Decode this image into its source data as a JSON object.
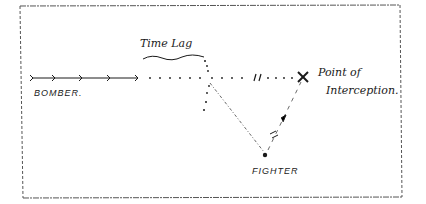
{
  "diagram": {
    "labels": {
      "time_lag": "Time Lag",
      "bomber": "BOMBER.",
      "point_of_interception_line1": "Point of",
      "point_of_interception_line2": "Interception.",
      "fighter": "FIGHTER"
    },
    "elements": {
      "bomber_track": "arrowed line then dotted line to point of interception",
      "fighter_track": "dashed line from fighter to point of interception",
      "reference_line": "dash-dot line from fighter back toward time-lag point",
      "time_lag_marker": "wavy underline with dotted drop line"
    },
    "colors": {
      "ink": "#1a1a1a",
      "background": "#ffffff",
      "frame": "#555555"
    }
  }
}
